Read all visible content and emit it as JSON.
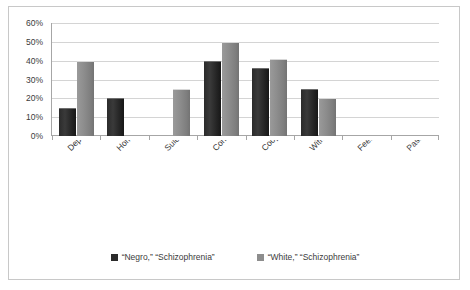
{
  "chart_data": {
    "type": "bar",
    "title": "",
    "xlabel": "",
    "ylabel": "",
    "ylim": [
      0,
      60
    ],
    "ytick_labels": [
      "60%",
      "50%",
      "40%",
      "30%",
      "20%",
      "10%",
      "0%"
    ],
    "ytick_values": [
      60,
      50,
      40,
      30,
      20,
      10,
      0
    ],
    "grid": true,
    "legend_position": "bottom",
    "categories": [
      "Depressed",
      "Homosexual, sex role confusion,",
      "Suicidal",
      "Confused",
      "Cooperative",
      "Withdrawn",
      "Feeble (minded)",
      "Passive"
    ],
    "series": [
      {
        "name": "“Negro,” “Schizophrenia”",
        "color": "#2b2b2b",
        "values": [
          15,
          20,
          0,
          40,
          36,
          25,
          0,
          0
        ]
      },
      {
        "name": "“White,” “Schizophrenia”",
        "color": "#8d8d8d",
        "values": [
          40,
          0,
          25,
          50,
          41,
          20,
          0,
          0
        ]
      }
    ]
  },
  "legend": {
    "entries": [
      {
        "label": "“Negro,” “Schizophrenia”"
      },
      {
        "label": "“White,” “Schizophrenia”"
      }
    ]
  }
}
